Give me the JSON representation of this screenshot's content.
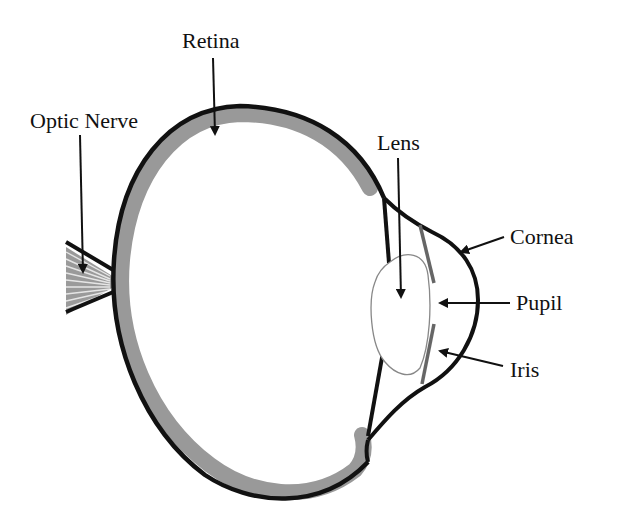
{
  "diagram": {
    "labels": {
      "retina": "Retina",
      "optic_nerve": "Optic Nerve",
      "lens": "Lens",
      "cornea": "Cornea",
      "pupil": "Pupil",
      "iris": "Iris"
    },
    "colors": {
      "outline": "#111111",
      "retina_fill": "#999999",
      "iris": "#666666",
      "lens_outline": "#888888",
      "background": "#ffffff"
    }
  }
}
